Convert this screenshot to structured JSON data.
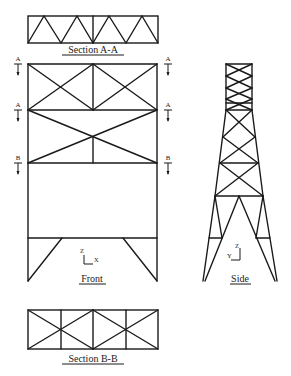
{
  "diagram": {
    "type": "structural-frame-drawing",
    "views": {
      "section_aa": {
        "title": "Section A-A"
      },
      "front": {
        "title": "Front",
        "axes": {
          "vertical": "Z",
          "horizontal": "X"
        }
      },
      "side": {
        "title": "Side",
        "axes": {
          "vertical": "Z",
          "horizontal": "Y"
        }
      },
      "section_bb": {
        "title": "Section B-B"
      }
    },
    "section_markers": {
      "left": [
        {
          "label": "A"
        },
        {
          "label": "A"
        },
        {
          "label": "B"
        }
      ],
      "right": [
        {
          "label": "A"
        },
        {
          "label": "A"
        },
        {
          "label": "B"
        }
      ]
    },
    "colors": {
      "line": "#1a1a1a",
      "background": "#ffffff"
    }
  }
}
